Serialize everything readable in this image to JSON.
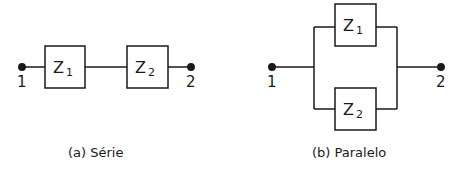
{
  "diagrams": [
    {
      "id": "serie",
      "caption": "(a) Série",
      "terminals": [
        "1",
        "2"
      ],
      "components": [
        {
          "label": "Z",
          "sub": "1"
        },
        {
          "label": "Z",
          "sub": "2"
        }
      ]
    },
    {
      "id": "paralelo",
      "caption": "(b) Paralelo",
      "terminals": [
        "1",
        "2"
      ],
      "components": [
        {
          "label": "Z",
          "sub": "1"
        },
        {
          "label": "Z",
          "sub": "2"
        }
      ]
    }
  ],
  "colors": {
    "stroke": "#1a1a1a",
    "background": "#ffffff"
  }
}
